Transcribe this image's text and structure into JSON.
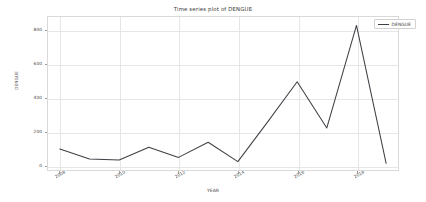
{
  "chart_data": {
    "type": "line",
    "title": "Time series plot of DENGUE",
    "xlabel": "YEAR",
    "ylabel": "DENGUE",
    "grid": true,
    "legend_position": "upper right",
    "line_color": "#3f3f46",
    "xlim": [
      2007.6,
      2019.4
    ],
    "ylim": [
      -30,
      880
    ],
    "yticks": [
      0,
      200,
      400,
      600,
      800
    ],
    "xticks": [
      2008,
      2010,
      2012,
      2014,
      2016,
      2018
    ],
    "series": [
      {
        "name": "DENGUE",
        "x": [
          2008,
          2009,
          2010,
          2011,
          2012,
          2013,
          2014,
          2015,
          2016,
          2017,
          2018,
          2019
        ],
        "values": [
          95,
          35,
          30,
          105,
          45,
          135,
          20,
          255,
          495,
          220,
          830,
          10
        ]
      }
    ]
  },
  "legend": {
    "entries": [
      {
        "label": "DENGUE"
      }
    ]
  },
  "ytick_labels": [
    "0",
    "200",
    "400",
    "600",
    "800"
  ],
  "xtick_labels": [
    "2008",
    "2010",
    "2012",
    "2014",
    "2016",
    "2018"
  ]
}
